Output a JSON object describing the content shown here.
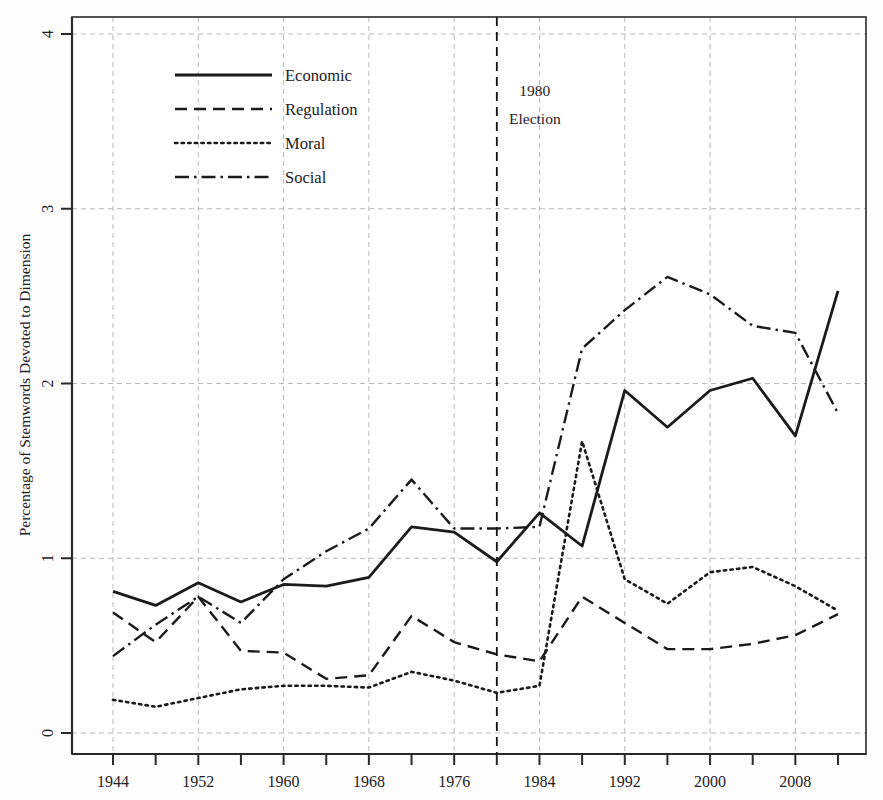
{
  "chart_data": {
    "type": "line",
    "title": "",
    "xlabel": "",
    "ylabel": "Percentage of Stemwords Devoted to Dimension",
    "xlim": [
      1944,
      2012
    ],
    "ylim": [
      0,
      4
    ],
    "grid": true,
    "legend_position": "top-left",
    "x": [
      1944,
      1948,
      1952,
      1956,
      1960,
      1964,
      1968,
      1972,
      1976,
      1980,
      1984,
      1988,
      1992,
      1996,
      2000,
      2004,
      2008,
      2012
    ],
    "xticks_major": [
      1944,
      1952,
      1960,
      1968,
      1976,
      1984,
      1992,
      2000,
      2008
    ],
    "xticks_minor": [
      1948,
      1956,
      1964,
      1972,
      1980,
      1988,
      1996,
      2004,
      2012
    ],
    "yticks": [
      0,
      1,
      2,
      3,
      4
    ],
    "series": [
      {
        "name": "Economic",
        "style": "solid",
        "values": [
          0.81,
          0.73,
          0.86,
          0.75,
          0.85,
          0.84,
          0.89,
          1.18,
          1.15,
          0.98,
          1.26,
          1.07,
          1.96,
          1.75,
          1.96,
          2.03,
          1.7,
          2.53
        ]
      },
      {
        "name": "Regulation",
        "style": "dashed",
        "values": [
          0.69,
          0.52,
          0.78,
          0.47,
          0.46,
          0.31,
          0.33,
          0.67,
          0.52,
          0.45,
          0.41,
          0.78,
          0.63,
          0.48,
          0.48,
          0.51,
          0.56,
          0.68
        ]
      },
      {
        "name": "Moral",
        "style": "dotted",
        "values": [
          0.19,
          0.15,
          0.2,
          0.25,
          0.27,
          0.27,
          0.26,
          0.35,
          0.3,
          0.23,
          0.27,
          1.67,
          0.88,
          0.74,
          0.92,
          0.95,
          0.84,
          0.7
        ]
      },
      {
        "name": "Social",
        "style": "dashdot",
        "values": [
          0.44,
          0.62,
          0.78,
          0.63,
          0.88,
          1.04,
          1.17,
          1.45,
          1.17,
          1.17,
          1.18,
          2.2,
          2.42,
          2.61,
          2.51,
          2.33,
          2.29,
          1.83
        ]
      }
    ],
    "annotations": [
      {
        "name": "election-marker",
        "x": 1980,
        "line1": "1980",
        "line2": "Election",
        "style": "vertical-dashed"
      }
    ]
  },
  "legend": {
    "items": [
      {
        "label": "Economic",
        "style": "solid"
      },
      {
        "label": "Regulation",
        "style": "dashed"
      },
      {
        "label": "Moral",
        "style": "dotted"
      },
      {
        "label": "Social",
        "style": "dashdot"
      }
    ]
  },
  "colors": {
    "line": "#1b1b1b",
    "grid": "#b9b9b9",
    "axis": "#2a2a28",
    "background": "#fdfdfc",
    "plot_background": "#ffffff"
  }
}
